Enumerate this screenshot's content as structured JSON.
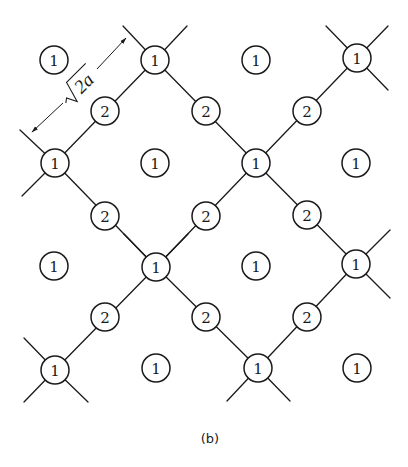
{
  "figure": {
    "caption": "(b)",
    "caption_pos": [
      210,
      438
    ],
    "atom_radius": 14,
    "dimension": {
      "label_sqrt": "√",
      "label_value": "2a",
      "from": [
        32,
        132
      ],
      "to": [
        126,
        38
      ],
      "label_pos": [
        80,
        86
      ]
    },
    "lattice_atoms": [
      {
        "type": "1",
        "x": 155,
        "y": 60
      },
      {
        "type": "1",
        "x": 357,
        "y": 58
      },
      {
        "type": "1",
        "x": 55,
        "y": 163
      },
      {
        "type": "1",
        "x": 256,
        "y": 163
      },
      {
        "type": "1",
        "x": 156,
        "y": 267
      },
      {
        "type": "1",
        "x": 356,
        "y": 264
      },
      {
        "type": "1",
        "x": 55,
        "y": 370
      },
      {
        "type": "1",
        "x": 258,
        "y": 368
      }
    ],
    "bridge_atoms": [
      {
        "type": "2",
        "x": 105,
        "y": 111
      },
      {
        "type": "2",
        "x": 206,
        "y": 111
      },
      {
        "type": "2",
        "x": 307,
        "y": 111
      },
      {
        "type": "2",
        "x": 105,
        "y": 216
      },
      {
        "type": "2",
        "x": 206,
        "y": 216
      },
      {
        "type": "2",
        "x": 307,
        "y": 215
      },
      {
        "type": "2",
        "x": 105,
        "y": 317
      },
      {
        "type": "2",
        "x": 206,
        "y": 317
      },
      {
        "type": "2",
        "x": 307,
        "y": 317
      }
    ],
    "isolated_atoms": [
      {
        "type": "1",
        "x": 54,
        "y": 60
      },
      {
        "type": "1",
        "x": 256,
        "y": 60
      },
      {
        "type": "1",
        "x": 155,
        "y": 163
      },
      {
        "type": "1",
        "x": 356,
        "y": 163
      },
      {
        "type": "1",
        "x": 54,
        "y": 266
      },
      {
        "type": "1",
        "x": 256,
        "y": 266
      },
      {
        "type": "1",
        "x": 156,
        "y": 368
      },
      {
        "type": "1",
        "x": 357,
        "y": 368
      }
    ],
    "bonds": [
      [
        155,
        60,
        55,
        163
      ],
      [
        155,
        60,
        256,
        163
      ],
      [
        256,
        163,
        357,
        58
      ],
      [
        256,
        163,
        356,
        264
      ],
      [
        256,
        163,
        156,
        267
      ],
      [
        55,
        163,
        156,
        267
      ],
      [
        156,
        267,
        55,
        370
      ],
      [
        156,
        267,
        258,
        368
      ],
      [
        356,
        264,
        258,
        368
      ],
      [
        155,
        60,
        123,
        26
      ],
      [
        155,
        60,
        187,
        26
      ],
      [
        357,
        58,
        326,
        26
      ],
      [
        357,
        58,
        388,
        26
      ],
      [
        357,
        58,
        388,
        90
      ],
      [
        55,
        163,
        20,
        130
      ],
      [
        55,
        163,
        22,
        196
      ],
      [
        156,
        267,
        124,
        234
      ],
      [
        156,
        267,
        188,
        234
      ],
      [
        356,
        264,
        390,
        230
      ],
      [
        356,
        264,
        390,
        298
      ],
      [
        55,
        370,
        24,
        338
      ],
      [
        55,
        370,
        24,
        402
      ],
      [
        55,
        370,
        88,
        402
      ],
      [
        258,
        368,
        227,
        401
      ],
      [
        258,
        368,
        290,
        401
      ]
    ]
  }
}
